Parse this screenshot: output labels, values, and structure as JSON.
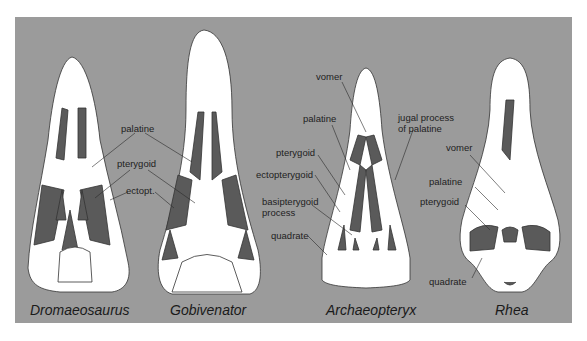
{
  "figure": {
    "background_color": "#9b9b9b",
    "bone_color": "#ffffff",
    "opening_color": "#5a5a5a",
    "specimens": [
      {
        "name": "Dromaeosaurus",
        "labels": [
          "palatine",
          "pterygoid",
          "ectopt."
        ]
      },
      {
        "name": "Gobivenator",
        "labels": []
      },
      {
        "name": "Archaeopteryx",
        "labels": [
          "vomer",
          "palatine",
          "pterygoid",
          "ectopterygoid",
          "basipterygoid",
          "process",
          "quadrate",
          "jugal process",
          "of palatine"
        ]
      },
      {
        "name": "Rhea",
        "labels": [
          "vomer",
          "palatine",
          "pterygoid",
          "quadrate"
        ]
      }
    ]
  }
}
